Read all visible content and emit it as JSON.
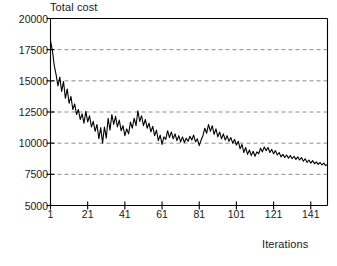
{
  "chart_data": {
    "type": "line",
    "title": "",
    "ylabel": "Total cost",
    "xlabel": "Iterations",
    "xlim": [
      1,
      150
    ],
    "ylim": [
      5000,
      20000
    ],
    "grid": true,
    "grid_axis": "y",
    "legend": "none",
    "yticks": [
      20000,
      17500,
      15000,
      12500,
      10000,
      7500,
      5000
    ],
    "ytick_labels": [
      "20000",
      "17500",
      "15000",
      "12500",
      "10000",
      "7500",
      "5000"
    ],
    "xticks": [
      1,
      21,
      41,
      61,
      81,
      101,
      121,
      141
    ],
    "xtick_labels": [
      "1",
      "21",
      "41",
      "61",
      "81",
      "101",
      "121",
      "141"
    ],
    "line_color": "#000000",
    "grid_color": "#8c8c8c",
    "axis_color": "#000000",
    "series": [
      {
        "name": "Total cost",
        "x": [
          1,
          2,
          3,
          4,
          5,
          6,
          7,
          8,
          9,
          10,
          11,
          12,
          13,
          14,
          15,
          16,
          17,
          18,
          19,
          20,
          21,
          22,
          23,
          24,
          25,
          26,
          27,
          28,
          29,
          30,
          31,
          32,
          33,
          34,
          35,
          36,
          37,
          38,
          39,
          40,
          41,
          42,
          43,
          44,
          45,
          46,
          47,
          48,
          49,
          50,
          51,
          52,
          53,
          54,
          55,
          56,
          57,
          58,
          59,
          60,
          61,
          62,
          63,
          64,
          65,
          66,
          67,
          68,
          69,
          70,
          71,
          72,
          73,
          74,
          75,
          76,
          77,
          78,
          79,
          80,
          81,
          82,
          83,
          84,
          85,
          86,
          87,
          88,
          89,
          90,
          91,
          92,
          93,
          94,
          95,
          96,
          97,
          98,
          99,
          100,
          101,
          102,
          103,
          104,
          105,
          106,
          107,
          108,
          109,
          110,
          111,
          112,
          113,
          114,
          115,
          116,
          117,
          118,
          119,
          120,
          121,
          122,
          123,
          124,
          125,
          126,
          127,
          128,
          129,
          130,
          131,
          132,
          133,
          134,
          135,
          136,
          137,
          138,
          139,
          140,
          141,
          142,
          143,
          144,
          145,
          146,
          147,
          148,
          149,
          150
        ],
        "values": [
          18200,
          17450,
          16250,
          15500,
          14600,
          15300,
          14150,
          14950,
          13600,
          14350,
          13200,
          13750,
          12700,
          13150,
          12300,
          12700,
          11900,
          12350,
          11600,
          12550,
          11700,
          12200,
          11300,
          11750,
          10950,
          11500,
          10350,
          11250,
          10000,
          11300,
          10400,
          12000,
          11050,
          12300,
          11500,
          12150,
          11300,
          11850,
          11000,
          11400,
          10600,
          11150,
          10750,
          11700,
          11200,
          12000,
          11400,
          12600,
          11750,
          12200,
          11400,
          11900,
          11200,
          11600,
          10900,
          11350,
          10600,
          11050,
          10200,
          10650,
          9900,
          10500,
          10300,
          11000,
          10450,
          10900,
          10350,
          10750,
          10200,
          10600,
          10100,
          10500,
          10050,
          10400,
          10150,
          10550,
          10250,
          10650,
          10100,
          10350,
          9800,
          10250,
          10600,
          11200,
          10800,
          11500,
          10950,
          11400,
          10700,
          11150,
          10500,
          10900,
          10350,
          10750,
          10250,
          10600,
          10150,
          10450,
          10000,
          10300,
          9850,
          10150,
          9550,
          9900,
          9250,
          9650,
          9100,
          9450,
          9000,
          9350,
          8950,
          9300,
          9150,
          9600,
          9300,
          9700,
          9400,
          9650,
          9250,
          9500,
          9150,
          9400,
          9050,
          9250,
          8900,
          9100,
          8850,
          9050,
          8800,
          9000,
          8750,
          8950,
          8700,
          8900,
          8650,
          8850,
          8550,
          8750,
          8450,
          8650,
          8400,
          8600,
          8350,
          8500,
          8300,
          8450,
          8250,
          8400,
          8200,
          8300
        ]
      }
    ]
  },
  "axes": {
    "y_title": "Total cost",
    "x_title": "Iterations"
  }
}
